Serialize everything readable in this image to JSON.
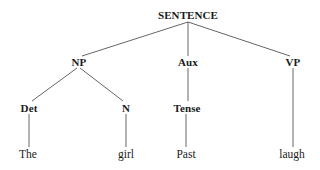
{
  "diagram": {
    "type": "syntax-tree",
    "nodes": {
      "root": {
        "label": "SENTENCE",
        "x": 188,
        "y": 15
      },
      "np": {
        "label": "NP",
        "x": 79,
        "y": 62
      },
      "aux": {
        "label": "Aux",
        "x": 188,
        "y": 62
      },
      "vp": {
        "label": "VP",
        "x": 293,
        "y": 62
      },
      "det": {
        "label": "Det",
        "x": 29,
        "y": 108
      },
      "n": {
        "label": "N",
        "x": 126,
        "y": 108
      },
      "tense": {
        "label": "Tense",
        "x": 187,
        "y": 108
      },
      "the": {
        "label": "The",
        "x": 28,
        "y": 155
      },
      "girl": {
        "label": "girl",
        "x": 126,
        "y": 155
      },
      "past": {
        "label": "Past",
        "x": 186,
        "y": 155
      },
      "laugh": {
        "label": "laugh",
        "x": 292,
        "y": 155
      }
    },
    "edges": [
      [
        "root",
        "np"
      ],
      [
        "root",
        "aux"
      ],
      [
        "root",
        "vp"
      ],
      [
        "np",
        "det"
      ],
      [
        "np",
        "n"
      ],
      [
        "aux",
        "tense"
      ],
      [
        "det",
        "the"
      ],
      [
        "n",
        "girl"
      ],
      [
        "tense",
        "past"
      ],
      [
        "vp",
        "laugh"
      ]
    ]
  }
}
